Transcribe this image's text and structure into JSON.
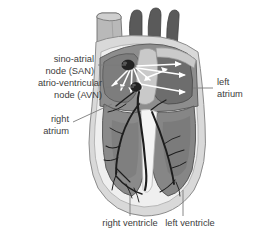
{
  "figure": {
    "style": "grayscale anatomical illustration",
    "background_color": "#ffffff"
  },
  "labels": {
    "san_line1": "sino-atrial",
    "san_line2": "node (SAN)",
    "avn_line1": "atrio-ventricular",
    "avn_line2": "node (AVN)",
    "right_atrium_line1": "right",
    "right_atrium_line2": "atrium",
    "left_atrium_line1": "left",
    "left_atrium_line2": "atrium",
    "right_ventricle": "right ventricle",
    "left_ventricle": "left ventricle"
  },
  "colors": {
    "text": "#3c3c3c",
    "leader_line": "#7a7a7a",
    "arrow": "#ffffff",
    "outer_pericardium": "#d9d9d9",
    "inner_rim": "#f2f2f2",
    "myocardium": "#8b8b8b",
    "chamber_dark": "#6d6d6d",
    "great_vessels": "#5a5a5a",
    "vena_cava": "#b4b4b4",
    "conduction_fibre": "#1d1d1d",
    "node": "#232323",
    "outline": "#5e5e5e"
  },
  "structures": {
    "san_node": "sino-atrial node",
    "avn_node": "atrio-ventricular node",
    "bundle_of_his": "bundle of His and Purkinje fibre network",
    "great_vessels": "aortic arch branches",
    "superior_vena_cava": "superior vena cava",
    "interventricular_septum": "interventricular septum",
    "apex": "apex of heart"
  },
  "conduction_arrows": {
    "from_san_fan": 5,
    "to_left_atrium": 3,
    "description": "white arrows showing impulse spread from the sino-atrial node across the atria"
  }
}
